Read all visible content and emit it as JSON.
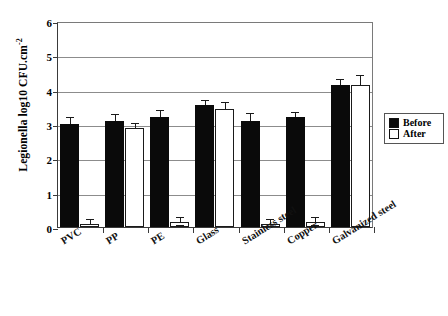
{
  "chart_data": {
    "type": "bar",
    "title": "",
    "xlabel": "",
    "ylabel": "Legionella log10 CFU.cm-2",
    "ylabel_base": "Legionella log10 CFU.cm",
    "ylabel_exponent": "-2",
    "ylim": [
      0,
      6
    ],
    "yticks": [
      0,
      1,
      2,
      3,
      4,
      5,
      6
    ],
    "ytick_labels": [
      "0",
      "1",
      "2",
      "3",
      "4",
      "5",
      "6"
    ],
    "grid": true,
    "legend_position": "right-outside",
    "categories": [
      "PVC",
      "PP",
      "PE",
      "Glass",
      "Stainless steel",
      "Copper",
      "Galvanized steel"
    ],
    "series": [
      {
        "name": "Before",
        "color": "#0a0a0a",
        "values": [
          3.0,
          3.1,
          3.2,
          3.55,
          3.1,
          3.2,
          4.15
        ],
        "errors": [
          0.18,
          0.15,
          0.18,
          0.13,
          0.18,
          0.12,
          0.12
        ]
      },
      {
        "name": "After",
        "color": "#ffffff",
        "values": [
          0.1,
          2.88,
          0.15,
          3.45,
          0.1,
          0.15,
          4.15
        ],
        "errors": [
          0.1,
          0.12,
          0.12,
          0.15,
          0.1,
          0.12,
          0.25
        ]
      }
    ]
  },
  "legend": {
    "items": [
      {
        "label": "Before",
        "style": "filled"
      },
      {
        "label": "After",
        "style": "open"
      }
    ]
  }
}
